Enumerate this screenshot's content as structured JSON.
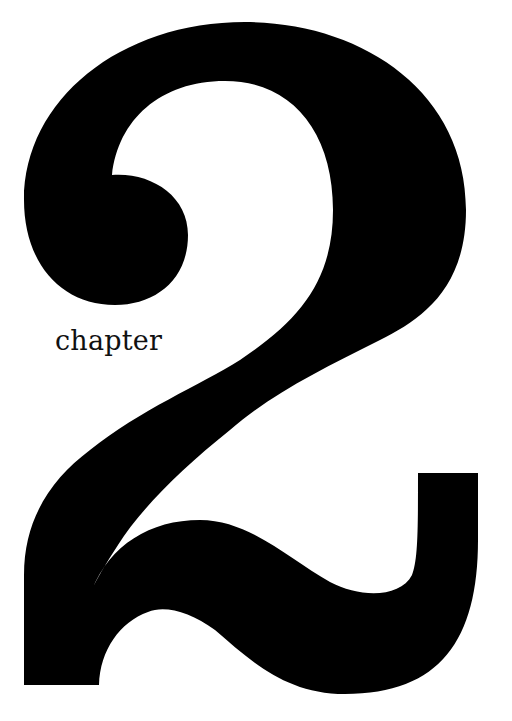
{
  "page": {
    "type": "chapter-opener",
    "background_color": "#ffffff",
    "ink_color": "#000000"
  },
  "chapter": {
    "label": "chapter",
    "number": "2"
  }
}
